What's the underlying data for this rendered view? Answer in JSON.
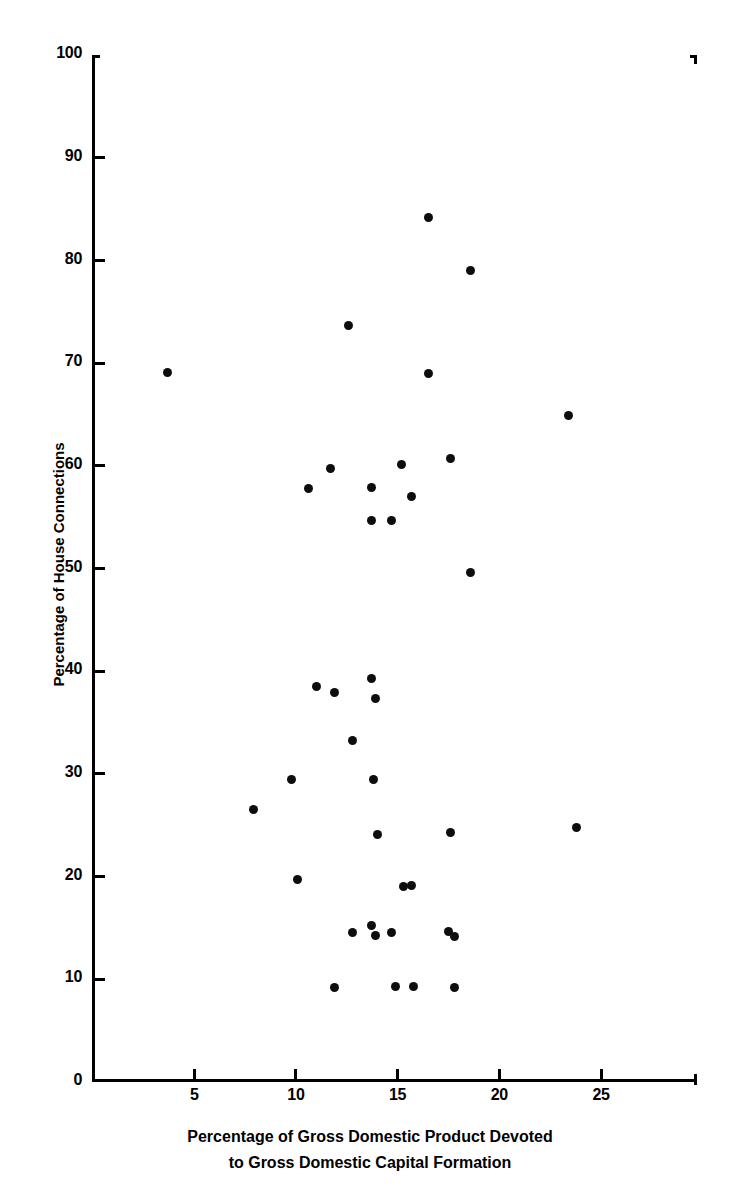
{
  "chart_data": {
    "type": "scatter",
    "title": "",
    "xlabel": "Percentage of Gross Domestic Product Devoted to Gross Domestic Capital Formation",
    "xlabel_line1": "Percentage of Gross Domestic Product Devoted",
    "xlabel_line2": "to Gross Domestic Capital Formation",
    "ylabel": "Percentage of House Connections",
    "xlim": [
      0,
      29.7
    ],
    "ylim": [
      0,
      100
    ],
    "xticks": [
      5,
      10,
      15,
      20,
      25
    ],
    "yticks": [
      0,
      10,
      20,
      30,
      40,
      50,
      60,
      70,
      80,
      90,
      100
    ],
    "xtick_labels": [
      "5",
      "10",
      "15",
      "20",
      "25"
    ],
    "ytick_labels": [
      "0",
      "10",
      "20",
      "30",
      "40",
      "50",
      "60",
      "70",
      "80",
      "90",
      "100"
    ],
    "grid": false,
    "legend": null,
    "marker": "filled-circle",
    "marker_color": "#0d0d0d",
    "points": [
      {
        "x": 3.7,
        "y": 69.1
      },
      {
        "x": 7.9,
        "y": 26.5
      },
      {
        "x": 9.8,
        "y": 29.5
      },
      {
        "x": 10.1,
        "y": 19.7
      },
      {
        "x": 10.6,
        "y": 57.8
      },
      {
        "x": 11.0,
        "y": 38.5
      },
      {
        "x": 11.7,
        "y": 59.8
      },
      {
        "x": 11.9,
        "y": 9.2
      },
      {
        "x": 11.9,
        "y": 37.9
      },
      {
        "x": 12.6,
        "y": 73.7
      },
      {
        "x": 12.8,
        "y": 33.3
      },
      {
        "x": 12.8,
        "y": 14.6
      },
      {
        "x": 13.7,
        "y": 57.9
      },
      {
        "x": 13.7,
        "y": 15.2
      },
      {
        "x": 13.7,
        "y": 39.3
      },
      {
        "x": 13.7,
        "y": 54.7
      },
      {
        "x": 13.8,
        "y": 29.5
      },
      {
        "x": 13.9,
        "y": 14.3
      },
      {
        "x": 13.9,
        "y": 37.4
      },
      {
        "x": 14.0,
        "y": 24.1
      },
      {
        "x": 14.7,
        "y": 54.7
      },
      {
        "x": 14.7,
        "y": 14.6
      },
      {
        "x": 14.9,
        "y": 9.3
      },
      {
        "x": 15.2,
        "y": 60.1
      },
      {
        "x": 15.3,
        "y": 19.0
      },
      {
        "x": 15.7,
        "y": 57.0
      },
      {
        "x": 15.8,
        "y": 9.3
      },
      {
        "x": 15.7,
        "y": 19.1
      },
      {
        "x": 16.5,
        "y": 84.2
      },
      {
        "x": 16.5,
        "y": 69.0
      },
      {
        "x": 17.6,
        "y": 60.7
      },
      {
        "x": 17.6,
        "y": 24.3
      },
      {
        "x": 17.5,
        "y": 14.7
      },
      {
        "x": 17.8,
        "y": 14.2
      },
      {
        "x": 17.8,
        "y": 9.2
      },
      {
        "x": 18.6,
        "y": 79.0
      },
      {
        "x": 18.6,
        "y": 49.6
      },
      {
        "x": 23.4,
        "y": 64.9
      },
      {
        "x": 23.8,
        "y": 24.8
      }
    ]
  },
  "axes": {
    "y_axis_name": "y-axis",
    "x_axis_name": "x-axis"
  }
}
